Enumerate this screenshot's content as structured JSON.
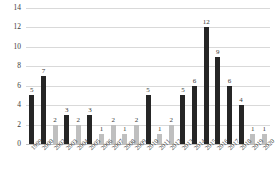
{
  "chart_data": {
    "type": "bar",
    "title": "",
    "xlabel": "",
    "ylabel": "",
    "ylim": [
      0,
      14
    ],
    "yticks": [
      0,
      2,
      4,
      6,
      8,
      10,
      12,
      14
    ],
    "grid": true,
    "legend": "none",
    "categories": [
      "1999",
      "2000",
      "2002",
      "2003",
      "2004",
      "2005",
      "2006",
      "2007",
      "2008",
      "2009",
      "2010",
      "2011",
      "2012",
      "2013",
      "2014",
      "2015",
      "2016",
      "2017",
      "2018",
      "2019",
      "2020"
    ],
    "values": [
      5,
      7,
      2,
      3,
      2,
      3,
      1,
      2,
      1,
      2,
      5,
      1,
      2,
      5,
      6,
      12,
      9,
      6,
      4,
      1,
      1
    ],
    "bar_colors": [
      "dark",
      "dark",
      "light",
      "dark",
      "light",
      "dark",
      "light",
      "light",
      "light",
      "light",
      "dark",
      "light",
      "light",
      "dark",
      "dark",
      "dark",
      "dark",
      "dark",
      "dark",
      "light",
      "light"
    ],
    "colors": {
      "dark": "#262626",
      "light": "#bfbfbf",
      "gridline": "#d9d9d9",
      "axis": "#bfbfbf",
      "text": "#3a3a3a",
      "background": "#ffffff"
    },
    "data_labels": [
      "5",
      "7",
      "2",
      "3",
      "2",
      "3",
      "1",
      "2",
      "1",
      "2",
      "5",
      "1",
      "2",
      "5",
      "6",
      "12",
      "9",
      "6",
      "4",
      "1",
      "1"
    ]
  }
}
